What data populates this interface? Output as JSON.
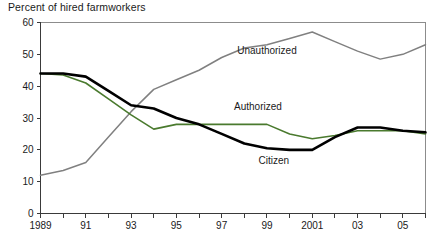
{
  "chart_data": {
    "type": "line",
    "title": "Percent of hired farmworkers",
    "xlabel": "",
    "ylabel": "",
    "ylim": [
      0,
      60
    ],
    "yticks": [
      0,
      10,
      20,
      30,
      40,
      50,
      60
    ],
    "ytick_labels": [
      "0",
      "10",
      "20",
      "30",
      "40",
      "50",
      "60"
    ],
    "xlim": [
      1989,
      2006
    ],
    "x": [
      1989,
      1990,
      1991,
      1992,
      1993,
      1994,
      1995,
      1996,
      1997,
      1998,
      1999,
      2000,
      2001,
      2002,
      2003,
      2004,
      2005,
      2006
    ],
    "xticks": [
      1989,
      1990,
      1991,
      1992,
      1993,
      1994,
      1995,
      1996,
      1997,
      1998,
      1999,
      2000,
      2001,
      2002,
      2003,
      2004,
      2005,
      2006
    ],
    "xtick_labels": [
      "1989",
      "",
      "91",
      "",
      "93",
      "",
      "95",
      "",
      "97",
      "",
      "99",
      "",
      "2001",
      "",
      "03",
      "",
      "05",
      ""
    ],
    "grid": false,
    "legend_position": "inline-annotations",
    "series": [
      {
        "name": "Unauthorized",
        "color": "#808080",
        "width": 1.5,
        "label_x": 1999,
        "label_y": 50,
        "values": [
          12,
          13.5,
          16,
          24,
          32,
          39,
          42,
          45,
          49,
          52,
          53,
          55,
          57,
          54,
          51,
          48.5,
          50,
          53
        ]
      },
      {
        "name": "Authorized",
        "color": "#4a7a2e",
        "width": 1.6,
        "label_x": 1998.6,
        "label_y": 32.5,
        "values": [
          44,
          43.5,
          41,
          36,
          31,
          26.5,
          28,
          28,
          28,
          28,
          28,
          25,
          23.5,
          24.5,
          26,
          26,
          26,
          25
        ]
      },
      {
        "name": "Citizen",
        "color": "#000000",
        "width": 2.6,
        "label_x": 1999.3,
        "label_y": 15.5,
        "values": [
          44,
          44,
          43,
          38.5,
          34,
          33,
          30,
          28,
          25,
          22,
          20.5,
          20,
          20,
          24,
          27,
          27,
          26,
          25.5
        ]
      }
    ]
  }
}
